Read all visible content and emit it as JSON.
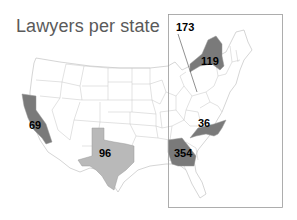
{
  "title": "Lawyers per state",
  "colors": {
    "dark": "#7a7a7a",
    "light": "#b9b9b9",
    "state_fill": "#ffffff",
    "border": "#b9b9b9",
    "inset_border": "#9a9a9a",
    "title": "#5a5a5a"
  },
  "states": [
    {
      "name": "California",
      "value": "69",
      "shade": "dark"
    },
    {
      "name": "Texas",
      "value": "96",
      "shade": "light"
    },
    {
      "name": "New York",
      "value": "119",
      "shade": "dark"
    },
    {
      "name": "Pennsylvania",
      "value": "173",
      "shade": "dark",
      "callout": true
    },
    {
      "name": "North Carolina",
      "value": "36",
      "shade": "dark"
    },
    {
      "name": "Georgia",
      "value": "354",
      "shade": "dark"
    }
  ]
}
